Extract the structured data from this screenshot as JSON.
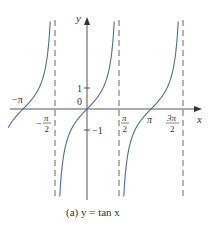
{
  "figure": {
    "caption": "(a) y = tan x",
    "function": "y = tan x",
    "curve_color": "#4a6fa5",
    "axis_color": "#555555",
    "asymptote_color": "#555555"
  },
  "axes": {
    "x_label": "x",
    "y_label": "y",
    "x_ticks": [
      "−π",
      "−π/2",
      "π/2",
      "π",
      "3π/2"
    ],
    "y_ticks": [
      "1",
      "0",
      "−1"
    ]
  },
  "labels": {
    "neg_pi": "−π",
    "neg_half_pi_num": "π",
    "neg_half_pi_den": "2",
    "neg_sign": "−",
    "half_pi_num": "π",
    "half_pi_den": "2",
    "pi": "π",
    "three_half_pi_num": "3π",
    "three_half_pi_den": "2",
    "one": "1",
    "zero": "0",
    "neg_one": "−1",
    "x": "x",
    "y": "y"
  },
  "asymptotes": [
    "x = −π/2",
    "x = π/2",
    "x = 3π/2"
  ]
}
